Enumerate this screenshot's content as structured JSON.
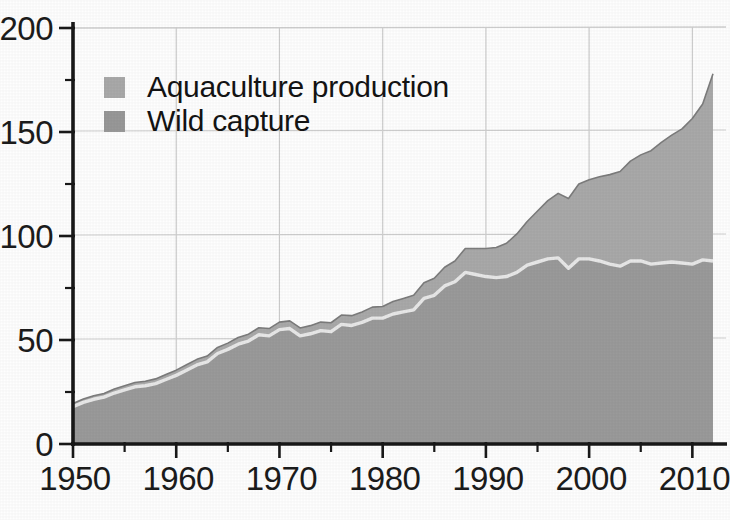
{
  "chart_data": {
    "type": "area",
    "stacked": true,
    "title": "",
    "subtitle": "",
    "xlabel": "",
    "ylabel": "",
    "xlim": [
      1950,
      2012
    ],
    "ylim": [
      0,
      200
    ],
    "yticks": [
      0,
      50,
      100,
      150,
      200
    ],
    "ytick_labels": [
      "0",
      "50",
      "100",
      "150",
      "200"
    ],
    "y_minor_ticks": [
      25,
      75,
      125,
      175
    ],
    "xticks": [
      1950,
      1960,
      1970,
      1980,
      1990,
      2000,
      2010
    ],
    "xtick_labels": [
      "1950",
      "1960",
      "1970",
      "1980",
      "1990",
      "2000",
      "2010"
    ],
    "x_minor_ticks": [
      1955,
      1965,
      1975,
      1985,
      1995,
      2005
    ],
    "grid": "vertical-at-decades-plus-top-line",
    "legend_position": "upper-left-inside",
    "x": [
      1950,
      1951,
      1952,
      1953,
      1954,
      1955,
      1956,
      1957,
      1958,
      1959,
      1960,
      1961,
      1962,
      1963,
      1964,
      1965,
      1966,
      1967,
      1968,
      1969,
      1970,
      1971,
      1972,
      1973,
      1974,
      1975,
      1976,
      1977,
      1978,
      1979,
      1980,
      1981,
      1982,
      1983,
      1984,
      1985,
      1986,
      1987,
      1988,
      1989,
      1990,
      1991,
      1992,
      1993,
      1994,
      1995,
      1996,
      1997,
      1998,
      1999,
      2000,
      2001,
      2002,
      2003,
      2004,
      2005,
      2006,
      2007,
      2008,
      2009,
      2010,
      2011,
      2012
    ],
    "series": [
      {
        "name": "Wild capture",
        "color": "#9a9a9a",
        "values": [
          18.0,
          20.0,
          21.5,
          22.5,
          24.5,
          26.0,
          27.5,
          28.0,
          29.0,
          31.0,
          33.0,
          35.5,
          38.0,
          39.5,
          43.5,
          45.5,
          48.0,
          49.5,
          52.5,
          52.0,
          55.0,
          55.5,
          52.0,
          53.0,
          54.5,
          54.0,
          57.5,
          57.0,
          58.5,
          60.5,
          60.5,
          62.5,
          63.5,
          64.5,
          70.0,
          71.5,
          76.0,
          78.0,
          82.5,
          81.5,
          80.5,
          80.0,
          80.5,
          82.5,
          86.0,
          87.5,
          89.0,
          89.5,
          84.5,
          89.0,
          89.0,
          88.0,
          86.5,
          85.5,
          88.0,
          88.0,
          86.5,
          87.0,
          87.5,
          87.0,
          86.5,
          88.5,
          88.0
        ]
      },
      {
        "name": "Aquaculture production",
        "color": "#a9a9a9",
        "values": [
          1.5,
          1.6,
          1.7,
          1.8,
          1.9,
          2.0,
          2.1,
          2.2,
          2.3,
          2.4,
          2.5,
          2.6,
          2.7,
          2.8,
          2.9,
          3.0,
          3.2,
          3.3,
          3.4,
          3.5,
          3.6,
          3.7,
          3.8,
          3.9,
          4.1,
          4.3,
          4.5,
          4.7,
          5.0,
          5.3,
          5.6,
          6.0,
          6.5,
          7.0,
          7.5,
          8.2,
          9.0,
          10.0,
          11.5,
          12.5,
          13.5,
          14.5,
          16.0,
          18.5,
          21.0,
          24.5,
          28.0,
          31.0,
          33.5,
          36.0,
          38.0,
          40.5,
          43.0,
          45.5,
          48.0,
          51.0,
          54.5,
          58.0,
          61.0,
          64.5,
          70.0,
          75.0,
          90.0
        ]
      }
    ]
  },
  "legend": {
    "items": [
      {
        "label": "Aquaculture production",
        "color": "#a9a9a9"
      },
      {
        "label": "Wild capture",
        "color": "#989898"
      }
    ]
  },
  "axes": {
    "y_labels": [
      "200",
      "150",
      "100",
      "50",
      "0"
    ],
    "x_labels": [
      "1950",
      "1960",
      "1970",
      "1980",
      "1990",
      "2000",
      "2010"
    ]
  },
  "colors": {
    "wild_capture": "#9a9a9a",
    "aquaculture": "#a9a9a9",
    "separator": "#e4e4e4",
    "axis": "#1a1a1a",
    "grid": "#c9c9c9",
    "background": "#fefefe"
  }
}
